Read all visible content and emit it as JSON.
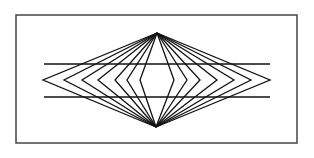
{
  "figure": {
    "type": "Hering-style optical illusion",
    "frame": {
      "x": 16,
      "y": 15,
      "width": 281,
      "height": 128,
      "stroke": "#444444"
    },
    "top_apex": [
      157,
      33
    ],
    "bottom_apex": [
      156,
      127
    ],
    "middle_y": 80,
    "vertices_left_x": [
      43,
      64,
      82,
      98,
      115,
      127,
      140
    ],
    "vertices_right_x": [
      174,
      187,
      200,
      217,
      234,
      251,
      270
    ],
    "parallel_lines": [
      {
        "y": 64,
        "x1": 44,
        "x2": 270
      },
      {
        "y": 97,
        "x1": 44,
        "x2": 270
      }
    ],
    "line_color": "#111111"
  }
}
